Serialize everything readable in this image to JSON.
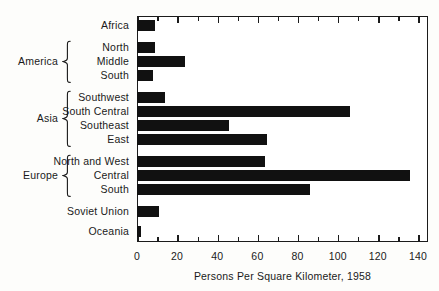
{
  "chart_data": {
    "type": "bar",
    "orientation": "horizontal",
    "title": "",
    "xlabel": "Persons Per Square Kilometer, 1958",
    "ylabel": "",
    "xlim": [
      0,
      145
    ],
    "xticks": [
      0,
      20,
      40,
      60,
      80,
      100,
      120,
      140
    ],
    "xtick_labels": [
      "0",
      "20",
      "40",
      "60",
      "80",
      "100",
      "120",
      "140"
    ],
    "minor_xticks": [
      10,
      30,
      50,
      70,
      90,
      110,
      130
    ],
    "grid": false,
    "legend": false,
    "bar_color": "#111111",
    "categories": [
      "Africa",
      "North",
      "Middle",
      "South",
      "Southwest",
      "South Central",
      "Southeast",
      "East",
      "North and West",
      "Central",
      "South",
      "Soviet Union",
      "Oceania"
    ],
    "values": [
      9,
      9,
      24,
      8,
      14,
      106,
      46,
      65,
      64,
      136,
      86,
      11,
      2
    ],
    "groups": [
      {
        "label": "America",
        "members": [
          "North",
          "Middle",
          "South"
        ]
      },
      {
        "label": "Asia",
        "members": [
          "Southwest",
          "South Central",
          "Southeast",
          "East"
        ]
      },
      {
        "label": "Europe",
        "members": [
          "North and West",
          "Central",
          "South"
        ]
      }
    ]
  },
  "axis": {
    "x_title": "Persons Per Square Kilometer, 1958"
  }
}
